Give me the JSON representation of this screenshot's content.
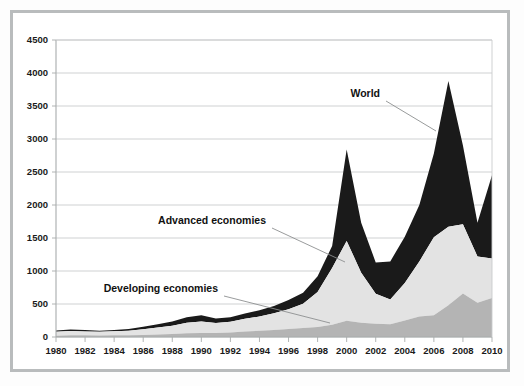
{
  "figure": {
    "background_color": "#ffffff",
    "frame_color": "#b9bcbd"
  },
  "chart_data": {
    "type": "area",
    "title": "",
    "subtitle": "",
    "xlabel": "",
    "ylabel": "",
    "xlim": [
      1980,
      2010
    ],
    "ylim": [
      0,
      4500
    ],
    "ytick_step": 500,
    "xtick_step": 2,
    "grid": true,
    "legend_position": "inline-annotations",
    "stacked": true,
    "x": [
      1980,
      1981,
      1982,
      1983,
      1984,
      1985,
      1986,
      1987,
      1988,
      1989,
      1990,
      1991,
      1992,
      1993,
      1994,
      1995,
      1996,
      1997,
      1998,
      1999,
      2000,
      2001,
      2002,
      2003,
      2004,
      2005,
      2006,
      2007,
      2008,
      2009,
      2010
    ],
    "xticks": [
      1980,
      1982,
      1984,
      1986,
      1988,
      1990,
      1992,
      1994,
      1996,
      1998,
      2000,
      2002,
      2004,
      2006,
      2008,
      2010
    ],
    "yticks": [
      0,
      500,
      1000,
      1500,
      2000,
      2500,
      3000,
      3500,
      4000,
      4500
    ],
    "xtick_labels": [
      "1980",
      "1982",
      "1984",
      "1986",
      "1988",
      "1990",
      "1992",
      "1994",
      "1996",
      "1998",
      "2000",
      "2002",
      "2004",
      "2006",
      "2008",
      "2010"
    ],
    "ytick_labels": [
      "0",
      "500",
      "1000",
      "1500",
      "2000",
      "2500",
      "3000",
      "3500",
      "4000",
      "4500"
    ],
    "series": [
      {
        "name": "Developing economies",
        "color": "#b4b4b4",
        "values": [
          20,
          25,
          25,
          22,
          25,
          28,
          32,
          38,
          45,
          55,
          60,
          62,
          70,
          85,
          95,
          105,
          120,
          135,
          150,
          185,
          245,
          215,
          200,
          195,
          250,
          310,
          330,
          480,
          660,
          520,
          590
        ]
      },
      {
        "name": "Advanced economies",
        "color": "#e3e3e3",
        "values": [
          60,
          65,
          60,
          58,
          62,
          68,
          85,
          105,
          125,
          160,
          175,
          150,
          160,
          190,
          215,
          255,
          300,
          370,
          530,
          860,
          1210,
          760,
          455,
          375,
          570,
          835,
          1180,
          1190,
          1050,
          700,
          600
        ]
      },
      {
        "name": "World",
        "color": "#1a1a1a",
        "stacked_total": [
          100,
          115,
          105,
          95,
          105,
          120,
          155,
          195,
          235,
          300,
          330,
          280,
          300,
          355,
          405,
          470,
          560,
          670,
          920,
          1380,
          2840,
          1730,
          1130,
          1145,
          1520,
          2000,
          2780,
          3880,
          2900,
          1730,
          2450
        ],
        "values": [
          20,
          25,
          20,
          15,
          18,
          24,
          38,
          52,
          65,
          85,
          95,
          68,
          70,
          80,
          95,
          110,
          140,
          165,
          240,
          335,
          1385,
          755,
          475,
          575,
          700,
          855,
          1270,
          2210,
          1190,
          510,
          1260
        ]
      }
    ],
    "annotations": [
      {
        "text": "World",
        "label_x": 380,
        "label_y": 97,
        "leader": [
          [
            386,
            101
          ],
          [
            436,
            131
          ]
        ]
      },
      {
        "text": "Advanced economies",
        "label_x": 266,
        "label_y": 224,
        "leader": [
          [
            272,
            228
          ],
          [
            345,
            262
          ]
        ]
      },
      {
        "text": "Developing economies",
        "label_x": 218,
        "label_y": 292,
        "leader": [
          [
            224,
            296
          ],
          [
            330,
            323
          ]
        ]
      }
    ]
  }
}
